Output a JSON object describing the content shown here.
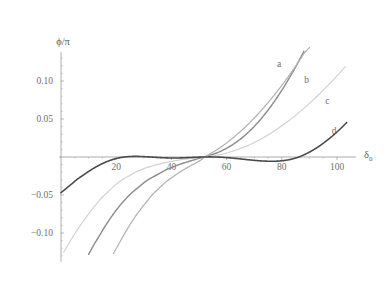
{
  "figure": {
    "background_color": "#ffffff",
    "axis_color": "#8a8a8a",
    "label_color": "#6f6f6f"
  },
  "axes": {
    "y_title": "ϕ/π",
    "x_title_base": "δ",
    "x_title_sub": "0"
  },
  "curve_labels": {
    "a": "a",
    "b": "b",
    "c": "c",
    "d": "d"
  },
  "chart_data": {
    "type": "line",
    "title": "",
    "xlabel": "δ₀",
    "ylabel": "ϕ/π",
    "xlim": [
      0,
      104
    ],
    "ylim": [
      -0.14,
      0.145
    ],
    "grid": false,
    "legend": "inline-curve-labels",
    "xticks": [
      20,
      40,
      60,
      80,
      100
    ],
    "xtick_labels": [
      "20",
      "40",
      "60",
      "80",
      "100"
    ],
    "yticks": [
      -0.1,
      -0.05,
      0.05,
      0.1
    ],
    "ytick_labels": [
      "−0.10",
      "−0.05",
      "0.05",
      "0.10"
    ],
    "x_minor_tick_step": 5,
    "y_minor_tick_step": 0.01,
    "crossing_point": {
      "x": 52,
      "y": 0
    },
    "series": [
      {
        "name": "a",
        "color": "#8b8b8b",
        "style": "dotted-thick",
        "label_position": {
          "x": 79,
          "y": 0.118
        },
        "points": [
          [
            8.0,
            -0.14
          ],
          [
            10.0,
            -0.128
          ],
          [
            12.0,
            -0.115
          ],
          [
            14.0,
            -0.103
          ],
          [
            16.0,
            -0.091
          ],
          [
            18.0,
            -0.08
          ],
          [
            20.0,
            -0.07
          ],
          [
            22.0,
            -0.061
          ],
          [
            24.0,
            -0.053
          ],
          [
            26.0,
            -0.046
          ],
          [
            28.0,
            -0.04
          ],
          [
            30.0,
            -0.034
          ],
          [
            32.0,
            -0.029
          ],
          [
            34.0,
            -0.025
          ],
          [
            36.0,
            -0.021
          ],
          [
            38.0,
            -0.017
          ],
          [
            40.0,
            -0.014
          ],
          [
            42.0,
            -0.011
          ],
          [
            44.0,
            -0.0085
          ],
          [
            46.0,
            -0.0062
          ],
          [
            48.0,
            -0.004
          ],
          [
            50.0,
            -0.0018
          ],
          [
            52.0,
            0.0
          ],
          [
            54.0,
            0.0022
          ],
          [
            56.0,
            0.0048
          ],
          [
            58.0,
            0.0078
          ],
          [
            60.0,
            0.0115
          ],
          [
            62.0,
            0.0158
          ],
          [
            64.0,
            0.0208
          ],
          [
            66.0,
            0.0265
          ],
          [
            68.0,
            0.033
          ],
          [
            70.0,
            0.0402
          ],
          [
            72.0,
            0.0482
          ],
          [
            74.0,
            0.057
          ],
          [
            76.0,
            0.0665
          ],
          [
            78.0,
            0.0768
          ],
          [
            80.0,
            0.0878
          ],
          [
            82.0,
            0.0996
          ],
          [
            84.0,
            0.112
          ],
          [
            86.0,
            0.1252
          ],
          [
            88.0,
            0.139
          ]
        ]
      },
      {
        "name": "b",
        "color": "#b0b0b0",
        "style": "dotted",
        "label_position": {
          "x": 89,
          "y": 0.097
        },
        "points": [
          [
            17.0,
            -0.14
          ],
          [
            19.0,
            -0.127
          ],
          [
            21.0,
            -0.114
          ],
          [
            23.0,
            -0.101
          ],
          [
            25.0,
            -0.089
          ],
          [
            27.0,
            -0.078
          ],
          [
            29.0,
            -0.068
          ],
          [
            31.0,
            -0.059
          ],
          [
            33.0,
            -0.05
          ],
          [
            35.0,
            -0.043
          ],
          [
            37.0,
            -0.036
          ],
          [
            39.0,
            -0.03
          ],
          [
            41.0,
            -0.025
          ],
          [
            43.0,
            -0.02
          ],
          [
            45.0,
            -0.0155
          ],
          [
            47.0,
            -0.0115
          ],
          [
            49.0,
            -0.0075
          ],
          [
            51.0,
            -0.0032
          ],
          [
            52.0,
            0.0
          ],
          [
            54.0,
            0.0042
          ],
          [
            56.0,
            0.0085
          ],
          [
            58.0,
            0.0133
          ],
          [
            60.0,
            0.0185
          ],
          [
            62.0,
            0.0242
          ],
          [
            64.0,
            0.0303
          ],
          [
            66.0,
            0.0368
          ],
          [
            68.0,
            0.0438
          ],
          [
            70.0,
            0.0512
          ],
          [
            72.0,
            0.059
          ],
          [
            74.0,
            0.0672
          ],
          [
            76.0,
            0.0758
          ],
          [
            78.0,
            0.0848
          ],
          [
            80.0,
            0.0942
          ],
          [
            82.0,
            0.104
          ],
          [
            84.0,
            0.1142
          ],
          [
            86.0,
            0.1248
          ],
          [
            88.0,
            0.1358
          ],
          [
            90.0,
            0.144
          ]
        ]
      },
      {
        "name": "c",
        "color": "#d2d2d2",
        "style": "solid-thin",
        "label_position": {
          "x": 96.5,
          "y": 0.07
        },
        "points": [
          [
            1.0,
            -0.125
          ],
          [
            3.0,
            -0.113
          ],
          [
            5.0,
            -0.101
          ],
          [
            7.0,
            -0.09
          ],
          [
            9.0,
            -0.08
          ],
          [
            11.0,
            -0.07
          ],
          [
            13.0,
            -0.061
          ],
          [
            15.0,
            -0.053
          ],
          [
            17.0,
            -0.046
          ],
          [
            19.0,
            -0.039
          ],
          [
            21.0,
            -0.033
          ],
          [
            23.0,
            -0.028
          ],
          [
            25.0,
            -0.024
          ],
          [
            27.0,
            -0.02
          ],
          [
            29.0,
            -0.017
          ],
          [
            31.0,
            -0.014
          ],
          [
            33.0,
            -0.0118
          ],
          [
            35.0,
            -0.0098
          ],
          [
            37.0,
            -0.008
          ],
          [
            39.0,
            -0.0064
          ],
          [
            41.0,
            -0.005
          ],
          [
            43.0,
            -0.0038
          ],
          [
            45.0,
            -0.0027
          ],
          [
            47.0,
            -0.0018
          ],
          [
            49.0,
            -0.001
          ],
          [
            52.0,
            0.0
          ],
          [
            55.0,
            0.0014
          ],
          [
            58.0,
            0.0035
          ],
          [
            61.0,
            0.0063
          ],
          [
            64.0,
            0.0098
          ],
          [
            67.0,
            0.014
          ],
          [
            70.0,
            0.019
          ],
          [
            73.0,
            0.0248
          ],
          [
            76.0,
            0.0313
          ],
          [
            79.0,
            0.0385
          ],
          [
            82.0,
            0.0463
          ],
          [
            85.0,
            0.0548
          ],
          [
            88.0,
            0.064
          ],
          [
            91.0,
            0.0738
          ],
          [
            94.0,
            0.0842
          ],
          [
            97.0,
            0.0952
          ],
          [
            100.0,
            0.1068
          ],
          [
            103.0,
            0.119
          ]
        ]
      },
      {
        "name": "d",
        "color": "#4a4a4a",
        "style": "dotted-dense",
        "label_position": {
          "x": 99,
          "y": 0.03
        },
        "points": [
          [
            0.0,
            -0.047
          ],
          [
            2.0,
            -0.041
          ],
          [
            4.0,
            -0.035
          ],
          [
            6.0,
            -0.029
          ],
          [
            8.0,
            -0.024
          ],
          [
            10.0,
            -0.019
          ],
          [
            12.0,
            -0.0145
          ],
          [
            14.0,
            -0.0105
          ],
          [
            16.0,
            -0.007
          ],
          [
            18.0,
            -0.0042
          ],
          [
            20.0,
            -0.002
          ],
          [
            22.0,
            -0.0005
          ],
          [
            24.0,
            0.0004
          ],
          [
            26.0,
            0.0008
          ],
          [
            28.0,
            0.0008
          ],
          [
            30.0,
            0.0005
          ],
          [
            32.0,
            0.0001
          ],
          [
            34.0,
            -0.0004
          ],
          [
            36.0,
            -0.0008
          ],
          [
            38.0,
            -0.0011
          ],
          [
            40.0,
            -0.0013
          ],
          [
            42.0,
            -0.0013
          ],
          [
            44.0,
            -0.0011
          ],
          [
            46.0,
            -0.0008
          ],
          [
            48.0,
            -0.0005
          ],
          [
            50.0,
            -0.0002
          ],
          [
            52.0,
            0.0
          ],
          [
            54.0,
            0.0001
          ],
          [
            56.0,
            0.0
          ],
          [
            58.0,
            -0.0003
          ],
          [
            60.0,
            -0.0008
          ],
          [
            62.0,
            -0.0014
          ],
          [
            64.0,
            -0.0021
          ],
          [
            66.0,
            -0.0029
          ],
          [
            68.0,
            -0.0037
          ],
          [
            70.0,
            -0.0044
          ],
          [
            72.0,
            -0.005
          ],
          [
            74.0,
            -0.0054
          ],
          [
            76.0,
            -0.0056
          ],
          [
            78.0,
            -0.0055
          ],
          [
            80.0,
            -0.005
          ],
          [
            82.0,
            -0.004
          ],
          [
            84.0,
            -0.0024
          ],
          [
            86.0,
            -0.0002
          ],
          [
            88.0,
            0.0028
          ],
          [
            90.0,
            0.0064
          ],
          [
            92.0,
            0.0106
          ],
          [
            94.0,
            0.0154
          ],
          [
            96.0,
            0.0208
          ],
          [
            98.0,
            0.0266
          ],
          [
            100.0,
            0.033
          ],
          [
            102.0,
            0.0398
          ],
          [
            103.5,
            0.0452
          ]
        ]
      }
    ]
  }
}
